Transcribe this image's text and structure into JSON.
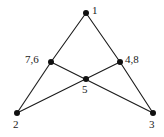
{
  "figure": {
    "name": "graph-diagram",
    "background_color": "#ffffff",
    "edge_color": "#1a1a1a",
    "node_color": "#111111",
    "label_color": "#1a1a1a"
  },
  "nodes": [
    {
      "id": "apex",
      "label": "1",
      "x": 86,
      "y": 13,
      "label_x": 92,
      "label_y": 5,
      "radius": 3.0
    },
    {
      "id": "left",
      "label": "7,6",
      "x": 51,
      "y": 62,
      "label_x": 25,
      "label_y": 54,
      "radius": 3.0
    },
    {
      "id": "right",
      "label": "4,8",
      "x": 120,
      "y": 62,
      "label_x": 125,
      "label_y": 54,
      "radius": 3.0
    },
    {
      "id": "center",
      "label": "5",
      "x": 86,
      "y": 79,
      "label_x": 82,
      "label_y": 84,
      "radius": 3.0
    },
    {
      "id": "bottomleft",
      "label": "2",
      "x": 17,
      "y": 113,
      "label_x": 13,
      "label_y": 119,
      "radius": 3.0
    },
    {
      "id": "bottomright",
      "label": "3",
      "x": 153,
      "y": 113,
      "label_x": 149,
      "label_y": 119,
      "radius": 3.0
    }
  ],
  "edges": [
    {
      "id": "edge-1-76",
      "from": "apex",
      "to": "left",
      "x1": 86,
      "y1": 13,
      "x2": 51,
      "y2": 62
    },
    {
      "id": "edge-1-48",
      "from": "apex",
      "to": "right",
      "x1": 86,
      "y1": 13,
      "x2": 120,
      "y2": 62
    },
    {
      "id": "edge-76-2",
      "from": "left",
      "to": "bottomleft",
      "x1": 51,
      "y1": 62,
      "x2": 17,
      "y2": 113
    },
    {
      "id": "edge-76-3",
      "from": "left",
      "to": "bottomright",
      "x1": 51,
      "y1": 62,
      "x2": 153,
      "y2": 113
    },
    {
      "id": "edge-2-48",
      "from": "bottomleft",
      "to": "right",
      "x1": 17,
      "y1": 113,
      "x2": 120,
      "y2": 62
    },
    {
      "id": "edge-48-3",
      "from": "right",
      "to": "bottomright",
      "x1": 120,
      "y1": 62,
      "x2": 153,
      "y2": 113
    }
  ]
}
